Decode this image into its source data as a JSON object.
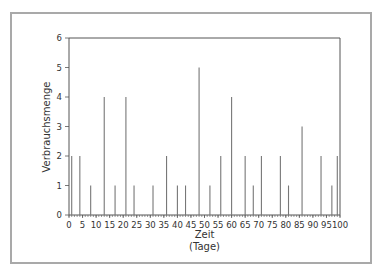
{
  "chart_data": {
    "type": "bar",
    "subtype": "stem",
    "title": "",
    "xlabel": "Zeit",
    "xlabel_unit": "(Tage)",
    "ylabel": "Verbrauchsmenge",
    "xlim": [
      0,
      100
    ],
    "ylim": [
      0,
      6
    ],
    "x_ticks": [
      0,
      5,
      10,
      15,
      20,
      25,
      30,
      35,
      40,
      45,
      50,
      55,
      60,
      65,
      70,
      75,
      80,
      85,
      90,
      95,
      100
    ],
    "y_ticks": [
      0,
      1,
      2,
      3,
      4,
      5,
      6
    ],
    "grid": false,
    "legend": null,
    "x": [
      1,
      4,
      8,
      13,
      17,
      21,
      24,
      31,
      36,
      40,
      43,
      48,
      52,
      56,
      60,
      65,
      68,
      71,
      78,
      81,
      86,
      93,
      97,
      99
    ],
    "values": [
      2,
      2,
      1,
      4,
      1,
      4,
      1,
      1,
      2,
      1,
      1,
      5,
      1,
      2,
      4,
      2,
      1,
      2,
      2,
      1,
      3,
      2,
      1,
      2
    ],
    "colors": {
      "stem": "#777777",
      "axis": "#555555",
      "frame": "#a9a9a9"
    }
  }
}
